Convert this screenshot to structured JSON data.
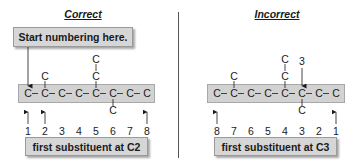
{
  "left": {
    "title": "Correct",
    "callout": "Start numbering here.",
    "chain_atoms": [
      "C",
      "C",
      "C",
      "C",
      "C",
      "C",
      "C",
      "C"
    ],
    "substituents": [
      {
        "position": 2,
        "side": "top",
        "atoms": [
          "C"
        ]
      },
      {
        "position": 5,
        "side": "top",
        "atoms": [
          "C",
          "C"
        ]
      },
      {
        "position": 6,
        "side": "bottom",
        "atoms": [
          "C"
        ]
      }
    ],
    "numbers": [
      "1",
      "2",
      "3",
      "4",
      "5",
      "6",
      "7",
      "8"
    ],
    "arrows_at": [
      1,
      2,
      8
    ],
    "result": "first substituent at C2"
  },
  "right": {
    "title": "Incorrect",
    "chain_atoms": [
      "C",
      "C",
      "C",
      "C",
      "C",
      "C",
      "C",
      "C"
    ],
    "substituents": [
      {
        "position": 2,
        "side": "top",
        "atoms": [
          "C"
        ]
      },
      {
        "position": 5,
        "side": "top",
        "atoms": [
          "C",
          "C"
        ]
      },
      {
        "position": 6,
        "side": "bottom",
        "atoms": [
          "C"
        ]
      }
    ],
    "pointer_label": "3",
    "numbers": [
      "8",
      "7",
      "6",
      "5",
      "4",
      "3",
      "2",
      "1"
    ],
    "arrows_at": [
      1,
      8
    ],
    "result": "first substituent at C3"
  },
  "colors": {
    "box_fill": "#d6d6d6",
    "chain_fill": "#d2d2d2",
    "text": "#1a1a1a",
    "divider": "#555555"
  }
}
